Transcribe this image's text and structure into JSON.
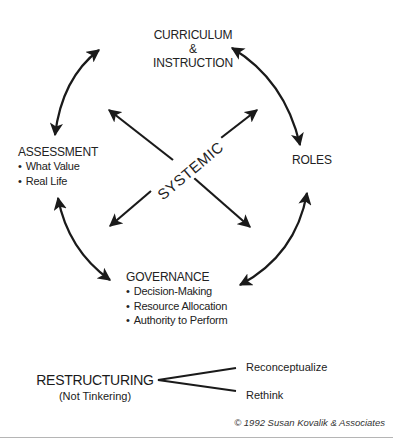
{
  "nodes": {
    "curriculum": {
      "line1": "CURRICULUM",
      "line2": "&",
      "line3": "INSTRUCTION"
    },
    "assessment": {
      "title": "ASSESSMENT",
      "bullets": [
        "What Value",
        "Real Life"
      ]
    },
    "roles": {
      "title": "ROLES"
    },
    "governance": {
      "title": "GOVERNANCE",
      "bullets": [
        "Decision-Making",
        "Resource Allocation",
        "Authority to Perform"
      ]
    }
  },
  "center": {
    "label": "SYSTEMIC"
  },
  "restructuring": {
    "title": "RESTRUCTURING",
    "subtitle": "(Not Tinkering)",
    "branches": [
      "Reconceptualize",
      "Rethink"
    ]
  },
  "footer": {
    "copyright": "© 1992 Susan Kovalik & Associates"
  },
  "colors": {
    "ink": "#1a1a1a",
    "background": "#ffffff",
    "divider": "#b5b5b5"
  }
}
